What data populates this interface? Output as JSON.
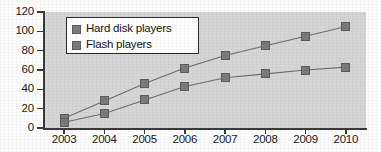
{
  "chart_data": {
    "type": "line",
    "title": "",
    "xlabel": "",
    "ylabel": "",
    "categories": [
      "2003",
      "2004",
      "2005",
      "2006",
      "2007",
      "2008",
      "2009",
      "2010"
    ],
    "series": [
      {
        "name": "Hard disk players",
        "values": [
          10,
          28,
          46,
          62,
          75,
          85,
          95,
          105
        ]
      },
      {
        "name": "Flash players",
        "values": [
          6,
          15,
          29,
          43,
          52,
          56,
          60,
          63
        ]
      }
    ],
    "ylim": [
      0,
      120
    ],
    "yticks": [
      0,
      20,
      40,
      60,
      80,
      100,
      120
    ],
    "ytick_labels": [
      "0",
      "20",
      "40",
      "60",
      "80",
      "100",
      "120"
    ],
    "xtick_labels": [
      "2003",
      "2004",
      "2005",
      "2006",
      "2007",
      "2008",
      "2009",
      "2010"
    ],
    "grid": false,
    "legend_position": "upper-left-inside",
    "marker": "square",
    "colors": {
      "marker": "#7b7b7b",
      "line": "#6e6e6e",
      "plot_background": "#d6d6d6",
      "axis": "#3a3a3a",
      "text": "#1a1a1a",
      "legend_background": "#ffffff",
      "legend_border": "#2b2b2b"
    }
  },
  "legend": {
    "items": [
      {
        "label": "Hard disk players"
      },
      {
        "label": "Flash players"
      }
    ]
  }
}
